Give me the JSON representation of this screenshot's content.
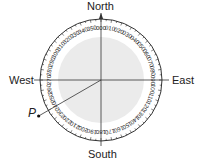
{
  "diagram": {
    "directions": {
      "north": "North",
      "south": "South",
      "east": "East",
      "west": "West"
    },
    "point_label": "P",
    "point_bearing": 240,
    "bearing_labels": [
      "000",
      "010",
      "020",
      "030",
      "040",
      "050",
      "060",
      "070",
      "080",
      "090",
      "100",
      "110",
      "120",
      "130",
      "140",
      "150",
      "160",
      "170",
      "180",
      "190",
      "200",
      "210",
      "220",
      "230",
      "240",
      "250",
      "260",
      "270",
      "280",
      "290",
      "300",
      "310",
      "320",
      "330",
      "340",
      "350"
    ],
    "colors": {
      "ring": "#ffffff",
      "disc": "#ebebeb",
      "stroke": "#333333",
      "text": "#222222"
    }
  }
}
